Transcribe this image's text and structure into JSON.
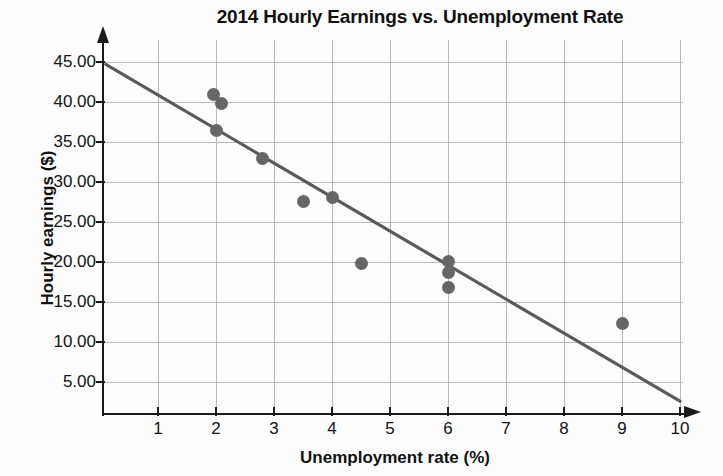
{
  "chart_data": {
    "type": "scatter",
    "title": "2014 Hourly Earnings vs. Unemployment Rate",
    "xlabel": "Unemployment rate (%)",
    "ylabel": "Hourly earnings ($)",
    "xlim": [
      0,
      10
    ],
    "ylim": [
      0,
      45
    ],
    "grid": true,
    "legend": false,
    "xticks": [
      1,
      2,
      3,
      4,
      5,
      6,
      7,
      8,
      9,
      10
    ],
    "xtick_labels": [
      "1",
      "2",
      "3",
      "4",
      "5",
      "6",
      "7",
      "8",
      "9",
      "10"
    ],
    "yticks": [
      5,
      10,
      15,
      20,
      25,
      30,
      35,
      40,
      45
    ],
    "ytick_labels": [
      "5.00",
      "10.00",
      "15.00",
      "20.00",
      "25.00",
      "30.00",
      "35.00",
      "40.00",
      "45.00"
    ],
    "points": [
      {
        "x": 1.95,
        "y": 40.9
      },
      {
        "x": 2.1,
        "y": 39.8
      },
      {
        "x": 2.0,
        "y": 36.5
      },
      {
        "x": 2.8,
        "y": 33.0
      },
      {
        "x": 3.5,
        "y": 27.6
      },
      {
        "x": 4.0,
        "y": 28.1
      },
      {
        "x": 4.5,
        "y": 19.8
      },
      {
        "x": 6.0,
        "y": 20.1
      },
      {
        "x": 6.0,
        "y": 18.7
      },
      {
        "x": 6.0,
        "y": 16.8
      },
      {
        "x": 9.0,
        "y": 12.3
      }
    ],
    "trendline": {
      "label": "linear fit",
      "x1": 0.1,
      "y1": 44.7,
      "x2": 10.0,
      "y2": 2.6
    },
    "marker_color": "#666666",
    "trendline_color": "#5a5a5a",
    "grid_color": "#b9b9b9",
    "axis_color": "#1a1a1a"
  },
  "icons": {
    "y_axis_arrow": "arrow-up-icon",
    "x_axis_arrow": "arrow-right-icon"
  }
}
